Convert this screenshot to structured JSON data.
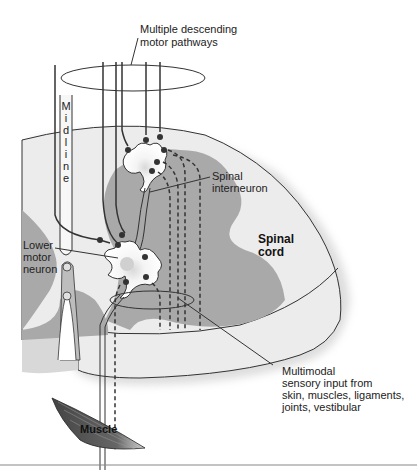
{
  "labels": {
    "descending_line1": "Multiple descending",
    "descending_line2": "motor pathways",
    "midline_letters": [
      "M",
      "i",
      "d",
      "l",
      "i",
      "n",
      "e"
    ],
    "interneuron_line1": "Spinal",
    "interneuron_line2": "interneuron",
    "cord_line1": "Spinal",
    "cord_line2": "cord",
    "lmn_line1": "Lower",
    "lmn_line2": "motor",
    "lmn_line3": "neuron",
    "sensory_line1": "Multimodal",
    "sensory_line2": "sensory input from",
    "sensory_line3": "skin, muscles, ligaments,",
    "sensory_line4": "joints, vestibular",
    "muscle": "Muscle"
  },
  "colors": {
    "white_matter": "#ececec",
    "gray_matter": "#a9a9a9",
    "outline": "#333333",
    "soma": "#e8e8e8",
    "synapse": "#333333"
  }
}
